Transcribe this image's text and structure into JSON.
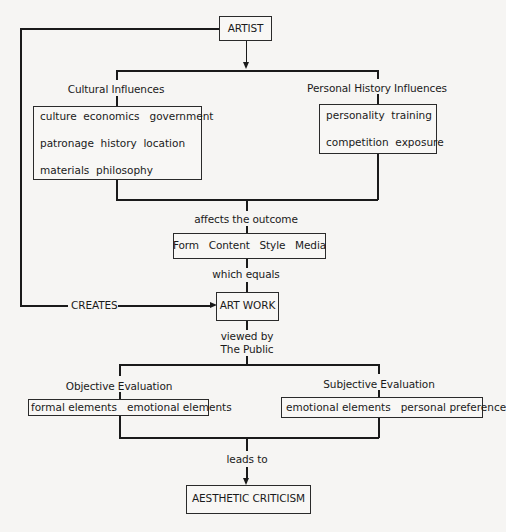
{
  "diagram": {
    "artist": "ARTIST",
    "cultural": {
      "heading": "Cultural Influences",
      "rows": [
        "culture  economics   government",
        "patronage  history  location",
        "materials  philosophy"
      ]
    },
    "personal": {
      "heading": "Personal History Influences",
      "rows": [
        "personality  training",
        "competition  exposure"
      ]
    },
    "affects": "affects the outcome",
    "form_box": "Form   Content   Style   Media",
    "which_equals": "which equals",
    "creates": "CREATES",
    "art_work": "ART WORK",
    "viewed_by": "viewed by",
    "the_public": "The Public",
    "objective": {
      "heading": "Objective Evaluation",
      "items": "formal elements   emotional elements"
    },
    "subjective": {
      "heading": "Subjective Evaluation",
      "items": "emotional elements   personal preference"
    },
    "leads_to": "leads to",
    "criticism": "AESTHETIC CRITICISM"
  }
}
